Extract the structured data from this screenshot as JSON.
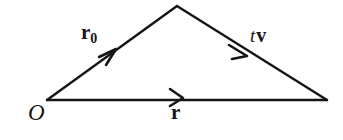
{
  "diagram": {
    "type": "vector-triangle",
    "background_color": "#ffffff",
    "stroke_color": "#151515",
    "stroke_width": 2.3,
    "width": 343,
    "height": 140,
    "points": {
      "origin": {
        "name": "O",
        "x": 47,
        "y": 100
      },
      "apex": {
        "name": "apex",
        "x": 177,
        "y": 6
      },
      "terminus": {
        "name": "terminus",
        "x": 327,
        "y": 100
      }
    },
    "vectors": [
      {
        "id": "r0",
        "label_text": "r",
        "subscript": "0",
        "style": "bold",
        "from": "origin",
        "to": "apex",
        "arrow_style": "open-barb",
        "arrow_at": {
          "x": 112,
          "y": 53
        },
        "label_position": {
          "x": 81,
          "y": 22
        }
      },
      {
        "id": "tv",
        "label_scalar": "t",
        "label_vector": "v",
        "style": "italic-scalar-bold-vector",
        "from": "apex",
        "to": "terminus",
        "arrow_style": "open-barb",
        "arrow_at": {
          "x": 243,
          "y": 52
        },
        "label_position": {
          "x": 250,
          "y": 25
        }
      },
      {
        "id": "r",
        "label_text": "r",
        "style": "bold",
        "from": "origin",
        "to": "terminus",
        "arrow_style": "open-barb",
        "arrow_at": {
          "x": 180,
          "y": 100
        },
        "label_position": {
          "x": 171,
          "y": 102
        }
      }
    ],
    "point_labels": [
      {
        "id": "origin",
        "text": "O",
        "style": "italic",
        "position": {
          "x": 28,
          "y": 101
        }
      }
    ]
  }
}
